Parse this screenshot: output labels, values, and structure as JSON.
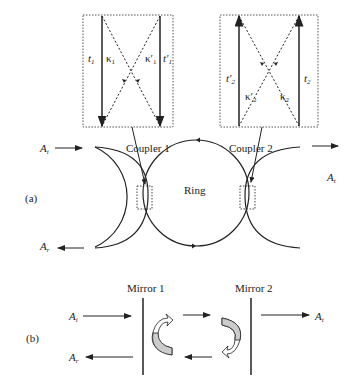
{
  "panel_a": {
    "label": "(a)",
    "coupler1": {
      "label": "Coupler 1",
      "inset": {
        "left_label": "t",
        "left_sub": "1",
        "kappa_label": "κ",
        "kappa_sub": "1",
        "kappa_prime_label": "κ′",
        "kappa_prime_sub": "1",
        "right_label": "t′",
        "right_sub": "1"
      }
    },
    "coupler2": {
      "label": "Coupler 2",
      "inset": {
        "left_label": "t′",
        "left_sub": "2",
        "kappa_prime_label": "κ′",
        "kappa_prime_sub": "2",
        "kappa_label": "κ",
        "kappa_sub": "2",
        "right_label": "t",
        "right_sub": "2"
      }
    },
    "ring_label": "Ring",
    "input_label": "A",
    "input_sub": "i",
    "reflect_label": "A",
    "reflect_sub": "r",
    "transmit_label": "A",
    "transmit_sub": "t"
  },
  "panel_b": {
    "label": "(b)",
    "mirror1_label": "Mirror 1",
    "mirror2_label": "Mirror 2",
    "input_label": "A",
    "input_sub": "i",
    "reflect_label": "A",
    "reflect_sub": "r",
    "transmit_label": "A",
    "transmit_sub": "t"
  }
}
